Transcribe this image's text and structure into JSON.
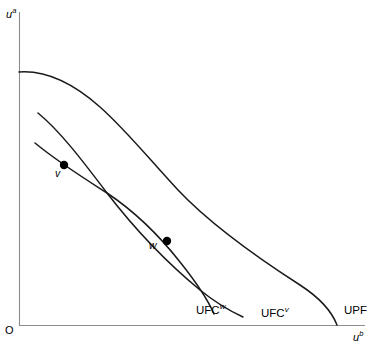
{
  "figure": {
    "domain": "economics-welfare-diagram",
    "background_color": "#ffffff",
    "curve_color": "#1a1a1a",
    "axis_color": "#8c8c8c"
  },
  "axes": {
    "y_label_base": "u",
    "y_label_sup": "a",
    "x_label_base": "u",
    "x_label_sup": "b",
    "origin_label": "O"
  },
  "curve_labels": {
    "ufc_w_base": "UFC",
    "ufc_w_sup": "w",
    "ufc_v_base": "UFC",
    "ufc_v_sup": "v",
    "upf": "UPF"
  },
  "points": {
    "v_label": "v",
    "w_label": "w"
  },
  "chart_data": {
    "type": "line",
    "title": "",
    "xlabel": "u^b",
    "ylabel": "u^a",
    "grid": false,
    "legend": "inline-curve-labels",
    "xlim": [
      0,
      376
    ],
    "ylim": [
      0,
      349
    ],
    "axis_pixels": {
      "origin_x": 19,
      "origin_y": 325,
      "y_axis_top": 12,
      "x_axis_right": 365
    },
    "series": [
      {
        "name": "UPF",
        "description": "Utility possibility frontier, outermost concave curve from y-axis to x-axis",
        "path": "M 19 72 C 46 70, 74 84, 100 107 C 126 130, 150 160, 178 190 C 212 226, 258 258, 300 285 C 320 298, 332 312, 337 325",
        "start": [
          19,
          72
        ],
        "end": [
          337,
          325
        ]
      },
      {
        "name": "UFC^v",
        "description": "Utility feasibility curve through point v, starts free of axis, crosses UFC^w",
        "path": "M 38 113 C 60 131, 82 160, 107 193 C 134 228, 166 262, 200 290 C 216 303, 230 311, 243 317",
        "start": [
          38,
          113
        ],
        "end": [
          243,
          317
        ]
      },
      {
        "name": "UFC^w",
        "description": "Utility feasibility curve through point w, starts free of axis, crosses UFC^v",
        "path": "M 35 143 C 58 162, 82 177, 107 193 C 134 211, 158 234, 180 262 C 196 282, 208 300, 214 314",
        "start": [
          35,
          143
        ],
        "end": [
          214,
          314
        ]
      }
    ],
    "markers": [
      {
        "label": "v",
        "x": 64,
        "y": 165,
        "on_curve": "UFC^w",
        "radius": 4.2
      },
      {
        "label": "w",
        "x": 167,
        "y": 241,
        "on_curve": "UFC^v",
        "radius": 4.2
      }
    ],
    "intersections": [
      {
        "curves": [
          "UFC^v",
          "UFC^w"
        ],
        "x": 107,
        "y": 193
      }
    ]
  }
}
